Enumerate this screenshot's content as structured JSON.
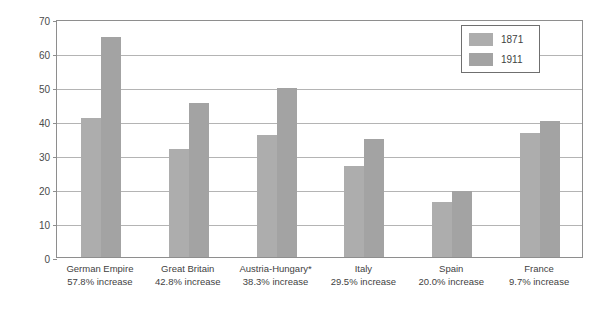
{
  "chart_data": {
    "type": "bar",
    "title": "",
    "xlabel": "",
    "ylabel": "Population (millions)",
    "ylim": [
      0,
      70
    ],
    "ytick_step": 10,
    "yticks": [
      "70",
      "60",
      "50",
      "40",
      "30",
      "20",
      "10",
      "0"
    ],
    "grid": true,
    "legend_position": "top-right",
    "categories": [
      "German Empire",
      "Great Britain",
      "Austria-Hungary*",
      "Italy",
      "Spain",
      "France"
    ],
    "category_sublabels": [
      "57.8% increase",
      "42.8% increase",
      "38.3% increase",
      "29.5% increase",
      "20.0% increase",
      "9.7% increase"
    ],
    "series": [
      {
        "name": "1871",
        "color": "#adadad",
        "values": [
          41.0,
          31.8,
          35.9,
          26.9,
          16.2,
          36.5
        ]
      },
      {
        "name": "1911",
        "color": "#a3a3a3",
        "values": [
          64.8,
          45.4,
          49.6,
          34.8,
          19.4,
          40.0
        ]
      }
    ]
  },
  "legend": {
    "entries": [
      {
        "label": "1871"
      },
      {
        "label": "1911"
      }
    ]
  },
  "colors": {
    "bar_1871": "#adadad",
    "bar_1911": "#a3a3a3",
    "gridline": "#b4b4b4",
    "axis": "#8e8e8e",
    "text": "#3f3f3f",
    "background": "#ffffff"
  }
}
